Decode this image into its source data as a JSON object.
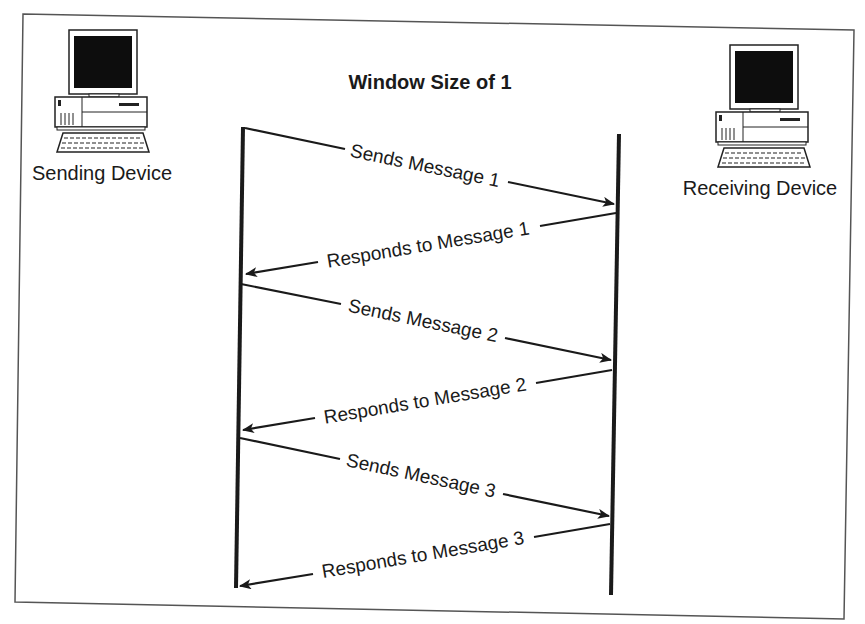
{
  "diagram": {
    "title": "Window Size of 1",
    "colors": {
      "background": "#ffffff",
      "ink": "#1a1a1a",
      "border": "#555555",
      "screen": "#0d0d0d"
    },
    "devices": {
      "sender": {
        "label": "Sending Device",
        "icon": "desktop-computer-icon"
      },
      "receiver": {
        "label": "Receiving Device",
        "icon": "desktop-computer-icon"
      }
    },
    "messages": [
      {
        "direction": "send",
        "label": "Sends Message 1"
      },
      {
        "direction": "respond",
        "label": "Responds to Message 1"
      },
      {
        "direction": "send",
        "label": "Sends Message 2"
      },
      {
        "direction": "respond",
        "label": "Responds to Message 2"
      },
      {
        "direction": "send",
        "label": "Sends Message 3"
      },
      {
        "direction": "respond",
        "label": "Responds to Message 3"
      }
    ]
  }
}
